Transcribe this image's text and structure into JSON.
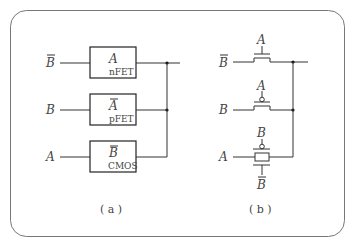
{
  "figure": {
    "panel_a": {
      "caption": "( a )",
      "rows": [
        {
          "input": "B",
          "input_overbar": true,
          "gate_control": "A",
          "control_overbar": false,
          "gate_type": "nFET"
        },
        {
          "input": "B",
          "input_overbar": false,
          "gate_control": "A",
          "control_overbar": true,
          "gate_type": "pFET"
        },
        {
          "input": "A",
          "input_overbar": false,
          "gate_control": "B",
          "control_overbar": true,
          "gate_type": "CMOS"
        }
      ]
    },
    "panel_b": {
      "caption": "( b )",
      "rows": [
        {
          "input": "B",
          "input_overbar": true,
          "gate": "A",
          "gate_bubble": false,
          "device": "nMOS"
        },
        {
          "input": "B",
          "input_overbar": false,
          "gate": "A",
          "gate_bubble": true,
          "device": "pMOS"
        },
        {
          "input": "A",
          "input_overbar": false,
          "gate_top": "B",
          "gate_bottom": "B",
          "gate_bottom_overbar": true,
          "device": "transmission-gate"
        }
      ]
    }
  }
}
